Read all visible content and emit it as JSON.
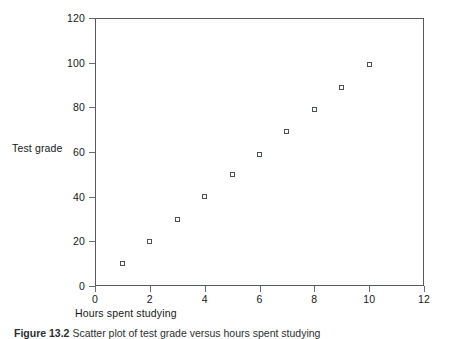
{
  "figure": {
    "caption_label": "Figure 13.2",
    "caption_text": "Scatter plot of test grade versus hours spent studying"
  },
  "chart_data": {
    "type": "scatter",
    "title": "",
    "xlabel": "Hours spent studying",
    "ylabel": "Test grade",
    "xlim": [
      0,
      12
    ],
    "ylim": [
      0,
      120
    ],
    "xticks": [
      "0",
      "2",
      "4",
      "6",
      "8",
      "10",
      "12"
    ],
    "xtick_values": [
      0,
      2,
      4,
      6,
      8,
      10,
      12
    ],
    "yticks": [
      "0",
      "20",
      "40",
      "60",
      "80",
      "100",
      "120"
    ],
    "ytick_values": [
      0,
      20,
      40,
      60,
      80,
      100,
      120
    ],
    "grid": false,
    "legend": false,
    "marker": "open-square",
    "marker_color": "#4d5256",
    "x": [
      1,
      2,
      3,
      4,
      5,
      6,
      7,
      8,
      9,
      10
    ],
    "y": [
      10,
      20,
      30,
      40,
      50,
      59,
      69,
      79,
      89,
      99
    ],
    "points": [
      {
        "x": 1,
        "y": 10
      },
      {
        "x": 2,
        "y": 20
      },
      {
        "x": 3,
        "y": 30
      },
      {
        "x": 4,
        "y": 40
      },
      {
        "x": 5,
        "y": 50
      },
      {
        "x": 6,
        "y": 59
      },
      {
        "x": 7,
        "y": 69
      },
      {
        "x": 8,
        "y": 79
      },
      {
        "x": 9,
        "y": 89
      },
      {
        "x": 10,
        "y": 99
      }
    ]
  }
}
